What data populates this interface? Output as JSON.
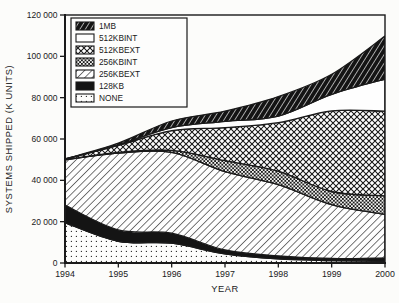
{
  "figure": {
    "background": "#fcfcfa",
    "ink": "#1a1a1a"
  },
  "chart_data": {
    "type": "area",
    "stacked": true,
    "title": "",
    "xlabel": "YEAR",
    "ylabel": "SYSTEMS SHIPPED (K UNITS)",
    "x": [
      1994,
      1995,
      1996,
      1997,
      1998,
      1999,
      2000
    ],
    "x_tick_labels": [
      "1994",
      "1995",
      "1996",
      "1997",
      "1998",
      "1999",
      "2000"
    ],
    "ylim": [
      0,
      120000
    ],
    "y_ticks": [
      0,
      20000,
      40000,
      60000,
      80000,
      100000,
      120000
    ],
    "y_tick_labels": [
      "0",
      "20 000",
      "40 000",
      "60 000",
      "80 000",
      "100 000",
      "120 000"
    ],
    "grid": false,
    "legend_position": "top-left",
    "legend_order_top_to_bottom": [
      "1MB",
      "512KBINT",
      "512KBEXT",
      "256KBINT",
      "256KBEXT",
      "128KB",
      "NONE"
    ],
    "series": [
      {
        "name": "NONE",
        "pattern": "sparse-dots",
        "values": [
          19500,
          10500,
          9600,
          4400,
          2000,
          1200,
          800
        ]
      },
      {
        "name": "128KB",
        "pattern": "solid-black",
        "values": [
          8500,
          5500,
          4800,
          1900,
          1500,
          1000,
          1700
        ]
      },
      {
        "name": "256KBEXT",
        "pattern": "diagonal-hatch",
        "values": [
          22000,
          37200,
          39100,
          37900,
          34400,
          26000,
          21000
        ]
      },
      {
        "name": "256KBINT",
        "pattern": "dense-checker",
        "values": [
          0,
          300,
          1000,
          5300,
          6500,
          6400,
          9000
        ]
      },
      {
        "name": "512KBEXT",
        "pattern": "crosshatch",
        "values": [
          300,
          3400,
          9500,
          16000,
          23500,
          39000,
          41000
        ]
      },
      {
        "name": "512KBINT",
        "pattern": "plain-white",
        "values": [
          0,
          300,
          1500,
          3000,
          3200,
          8000,
          15500
        ]
      },
      {
        "name": "1MB",
        "pattern": "dark-diagonal-hatch",
        "values": [
          0,
          800,
          3200,
          5000,
          9400,
          9700,
          20800
        ]
      }
    ],
    "totals": [
      50300,
      58000,
      68700,
      73500,
      80500,
      91300,
      109800
    ]
  }
}
